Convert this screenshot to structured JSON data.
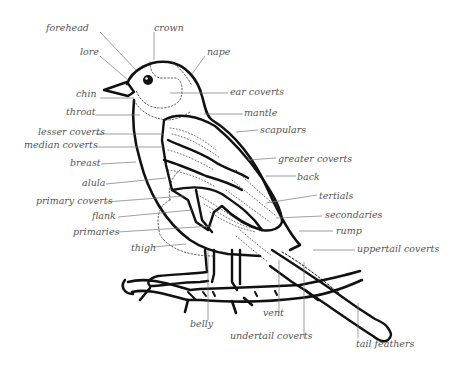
{
  "diagram": {
    "colors": {
      "ink": "#111111",
      "leader": "#777777",
      "label": "#555555",
      "background": "#ffffff"
    },
    "labels": {
      "forehead": "forehead",
      "crown": "crown",
      "nape": "nape",
      "lore": "lore",
      "chin": "chin",
      "throat": "throat",
      "ear_coverts": "ear coverts",
      "mantle": "mantle",
      "lesser_coverts": "lesser coverts",
      "median_coverts": "median coverts",
      "scapulars": "scapulars",
      "breast": "breast",
      "greater_coverts": "greater coverts",
      "back": "back",
      "alula": "alula",
      "tertials": "tertials",
      "primary_coverts": "primary coverts",
      "secondaries": "secondaries",
      "flank": "flank",
      "rump": "rump",
      "primaries": "primaries",
      "uppertail_coverts": "uppertail coverts",
      "thigh": "thigh",
      "belly": "belly",
      "vent": "vent",
      "undertail_coverts": "undertail coverts",
      "tail_feathers": "tail feathers"
    }
  }
}
